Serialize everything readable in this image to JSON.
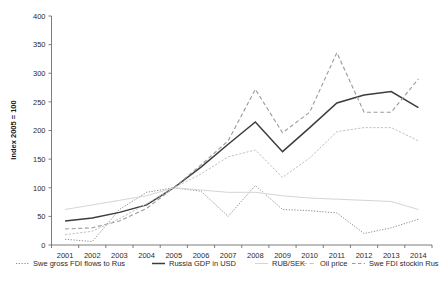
{
  "chart_data": {
    "type": "line",
    "title": "",
    "xlabel": "",
    "ylabel": "Index 2005 = 100",
    "categories": [
      "2001",
      "2002",
      "2003",
      "2004",
      "2005",
      "2006",
      "2007",
      "2008",
      "2009",
      "2010",
      "2011",
      "2012",
      "2013",
      "2014"
    ],
    "x": [
      2001,
      2002,
      2003,
      2004,
      2005,
      2006,
      2007,
      2008,
      2009,
      2010,
      2011,
      2012,
      2013,
      2014
    ],
    "ylim": [
      0,
      400
    ],
    "yticks": [
      0,
      50,
      100,
      150,
      200,
      250,
      300,
      350,
      400
    ],
    "ytick_labels": [
      "0",
      "50",
      "100",
      "150",
      "200",
      "250",
      "300",
      "350",
      "400"
    ],
    "grid": false,
    "legend_position": "bottom",
    "series": [
      {
        "name": "Swe gross FDI flows to Rus",
        "style": "dotted",
        "color": "#8a8a8a",
        "values": [
          10,
          6,
          62,
          92,
          100,
          94,
          50,
          104,
          62,
          60,
          56,
          20,
          30,
          45
        ]
      },
      {
        "name": "Russia GDP in USD",
        "style": "solid",
        "color": "#3c3c3c",
        "values": [
          42,
          47,
          57,
          70,
          100,
          136,
          176,
          215,
          163,
          205,
          248,
          262,
          268,
          240
        ]
      },
      {
        "name": "RUB/SEK",
        "style": "solid-light",
        "color": "#d5d5d5",
        "values": [
          62,
          70,
          78,
          86,
          100,
          96,
          92,
          92,
          86,
          82,
          80,
          78,
          76,
          62
        ]
      },
      {
        "name": "Oil price",
        "style": "dashed",
        "color": "#9a9a9a",
        "values": [
          28,
          30,
          42,
          64,
          100,
          140,
          182,
          272,
          196,
          232,
          336,
          232,
          232,
          290
        ]
      },
      {
        "name": "Swe FDI stockin Rus",
        "style": "dash-dot",
        "color": "#c0c0c0",
        "values": [
          18,
          24,
          46,
          72,
          100,
          124,
          154,
          166,
          118,
          152,
          198,
          205,
          205,
          182
        ]
      }
    ]
  },
  "axis": {
    "y_title": "Index 2005 = 100"
  },
  "legend": {
    "items": [
      {
        "label": "Swe gross FDI flows to Rus",
        "swatch": "dotted",
        "color": "#8a8a8a"
      },
      {
        "label": "Russia GDP in USD",
        "swatch": "solid",
        "color": "#3c3c3c"
      },
      {
        "label": "RUB/SEK",
        "swatch": "solid-light",
        "color": "#d5d5d5"
      },
      {
        "label": "Oil price",
        "swatch": "dash-light",
        "color": "#b8b8b8"
      },
      {
        "label": "Swe FDI stockin Rus",
        "swatch": "dash-dot",
        "color": "#9a9a9a"
      }
    ]
  }
}
